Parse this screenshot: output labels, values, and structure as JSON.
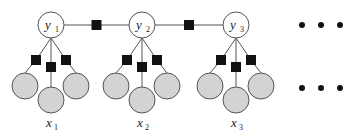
{
  "diagram": {
    "type": "factor-graph",
    "colors": {
      "latent_fill": "#ffffff",
      "observed_fill": "#d3d3d3",
      "factor_fill": "#111111",
      "stroke": "#555555",
      "ellipsis": "#111111"
    },
    "groups": [
      {
        "latent_label": "y",
        "latent_sub": "1",
        "observed_label": "x",
        "observed_sub": "1"
      },
      {
        "latent_label": "y",
        "latent_sub": "2",
        "observed_label": "x",
        "observed_sub": "2"
      },
      {
        "latent_label": "y",
        "latent_sub": "3",
        "observed_label": "x",
        "observed_sub": "3"
      }
    ],
    "observed_per_group": 3,
    "ellipsis_rows": [
      "latent",
      "observed"
    ]
  }
}
